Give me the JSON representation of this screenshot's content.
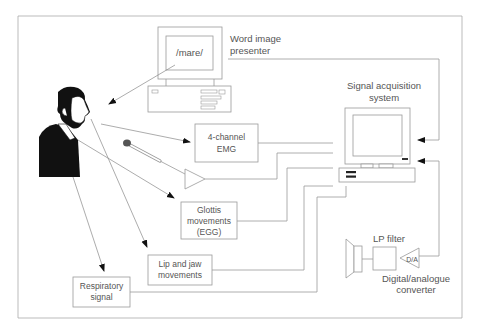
{
  "diagram": {
    "word_image_presenter": {
      "screen_text": "/mare/",
      "label_line1": "Word image",
      "label_line2": "presenter"
    },
    "signal_acquisition": {
      "label_line1": "Signal acquisition",
      "label_line2": "system"
    },
    "emg_box": {
      "line1": "4-channel",
      "line2": "EMG"
    },
    "glottis_box": {
      "line1": "Glottis",
      "line2": "movements",
      "line3": "(EGG)"
    },
    "lip_jaw_box": {
      "line1": "Lip and jaw",
      "line2": "movements"
    },
    "respiratory_box": {
      "line1": "Respiratory",
      "line2": "signal"
    },
    "lp_filter": {
      "label": "LP filter"
    },
    "da_converter": {
      "glyph": "D/A",
      "label_line1": "Digital/analogue",
      "label_line2": "converter"
    },
    "icons": {
      "speaker": "speaker-icon",
      "microphone": "microphone-icon",
      "amplifier": "amplifier-triangle-icon",
      "person": "speaker-person-icon"
    }
  }
}
